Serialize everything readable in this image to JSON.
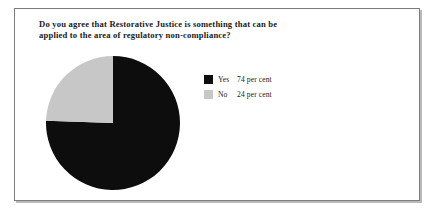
{
  "chart_data": {
    "type": "pie",
    "title": "Do you agree that Restorative Justice is something that can be\napplied to the area of regulatory non-compliance?",
    "title_line_1": "Do you agree that Restorative Justice is something that can be",
    "title_line_2": "applied to the area of regulatory non-compliance?",
    "xlabel": "",
    "ylabel": "",
    "grid": false,
    "legend_position": "right",
    "slices": [
      {
        "label": "Yes",
        "value": 74,
        "value_text": "74 per cent",
        "color": "#0d0d0d",
        "start_angle_deg": 0,
        "sweep_deg": 266.4
      },
      {
        "label": "No",
        "value": 24,
        "value_text": "24 per cent",
        "color": "#c7c7c7",
        "start_angle_deg": 266.4,
        "sweep_deg": 93.6
      }
    ],
    "categories": [
      "Yes",
      "No"
    ],
    "values": [
      74,
      24
    ],
    "value_labels": [
      "74 per cent",
      "24 per cent"
    ],
    "units": "per cent"
  },
  "legend": {
    "rows": [
      {
        "label": "Yes",
        "value_text": "74 per cent"
      },
      {
        "label": "No",
        "value_text": "24 per cent"
      }
    ]
  },
  "colors": {
    "slice_yes": "#0d0d0d",
    "slice_no": "#c7c7c7",
    "frame_border": "#7d7d7d",
    "text": "#1a1a1a",
    "background": "#ffffff"
  }
}
